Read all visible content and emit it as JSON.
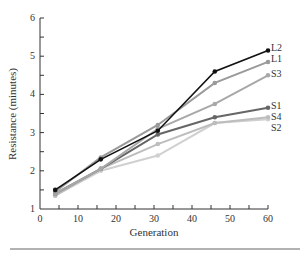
{
  "chart_data": {
    "type": "line",
    "title": "",
    "xlabel": "Generation",
    "ylabel": "Resistance (minutes)",
    "xlim": [
      0,
      60
    ],
    "ylim": [
      1,
      6
    ],
    "xticks": [
      0,
      10,
      20,
      30,
      40,
      50,
      60
    ],
    "yticks": [
      1,
      2,
      3,
      4,
      5,
      6
    ],
    "grid": false,
    "legend_position": "inline-right",
    "x": [
      4,
      16,
      31,
      46,
      60
    ],
    "series": [
      {
        "name": "L2",
        "color": "#111111",
        "values": [
          1.5,
          2.3,
          3.05,
          4.6,
          5.15
        ]
      },
      {
        "name": "L1",
        "color": "#9a9a9a",
        "values": [
          1.45,
          2.35,
          3.2,
          4.3,
          4.85
        ]
      },
      {
        "name": "S3",
        "color": "#a8a8a8",
        "values": [
          1.4,
          2.05,
          3.1,
          3.75,
          4.5
        ]
      },
      {
        "name": "S1",
        "color": "#666666",
        "values": [
          1.4,
          2.05,
          2.95,
          3.4,
          3.65
        ]
      },
      {
        "name": "S4",
        "color": "#bdbdbd",
        "values": [
          1.35,
          2.05,
          2.7,
          3.25,
          3.4
        ]
      },
      {
        "name": "S2",
        "color": "#d0d0d0",
        "values": [
          1.35,
          2.0,
          2.4,
          3.25,
          3.35
        ]
      }
    ]
  }
}
